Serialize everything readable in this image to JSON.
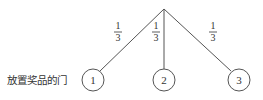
{
  "diagram": {
    "type": "probability-tree",
    "root": {
      "x": 164,
      "y": 9
    },
    "row_label": "放置奖品的门",
    "branches": [
      {
        "probability_num": "1",
        "probability_den": "3",
        "node_label": "1",
        "node": {
          "x": 93,
          "y": 80
        },
        "label_pos": {
          "x": 118,
          "y": 32
        }
      },
      {
        "probability_num": "1",
        "probability_den": "3",
        "node_label": "2",
        "node": {
          "x": 164,
          "y": 80
        },
        "label_pos": {
          "x": 156,
          "y": 32
        }
      },
      {
        "probability_num": "1",
        "probability_den": "3",
        "node_label": "3",
        "node": {
          "x": 239,
          "y": 80
        },
        "label_pos": {
          "x": 213,
          "y": 32
        }
      }
    ],
    "colors": {
      "line": "#555555",
      "text": "#333333",
      "background": "#ffffff"
    }
  }
}
